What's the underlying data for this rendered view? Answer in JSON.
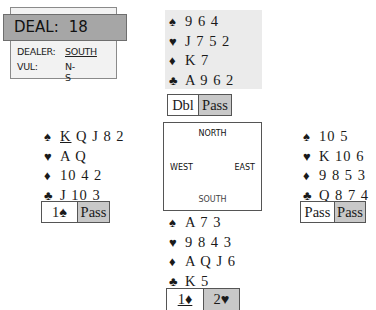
{
  "info": {
    "deal_label": "DEAL:",
    "deal_number": "18",
    "dealer_label": "DEALER:",
    "dealer_value": "SOUTH",
    "vul_label": "VUL:",
    "vul_value": "N-S"
  },
  "suits": {
    "spade": "♠",
    "heart": "♥",
    "diamond": "♦",
    "club": "♣"
  },
  "hands": {
    "north": {
      "spades": "9 6 4",
      "hearts": "J 7 5 2",
      "diamonds": "K 7",
      "clubs": "A 9 6 2"
    },
    "west": {
      "spades_first": "K",
      "spades_rest": "Q J 8 2",
      "hearts": "A Q",
      "diamonds": "10 4 2",
      "clubs": "J 10 3"
    },
    "east": {
      "spades": "10 5",
      "hearts": "K 10 6",
      "diamonds": "9 8 5 3",
      "clubs": "Q 8 7 4"
    },
    "south": {
      "spades": "A 7 3",
      "hearts": "9 8 4 3",
      "diamonds": "A Q J 6",
      "clubs": "K 5"
    }
  },
  "bids": {
    "north": [
      "Dbl",
      "Pass"
    ],
    "west": [
      "1♠",
      "Pass"
    ],
    "east": [
      "Pass",
      "Pass"
    ],
    "south": [
      "1♦",
      "2♥"
    ]
  },
  "compass": {
    "north": "NORTH",
    "south": "SOUTH",
    "west": "WEST",
    "east": "EAST"
  },
  "colors": {
    "header_gray": "#a6a6a6",
    "bid_gray": "#c8c8c8",
    "north_bg": "#ebebeb"
  }
}
